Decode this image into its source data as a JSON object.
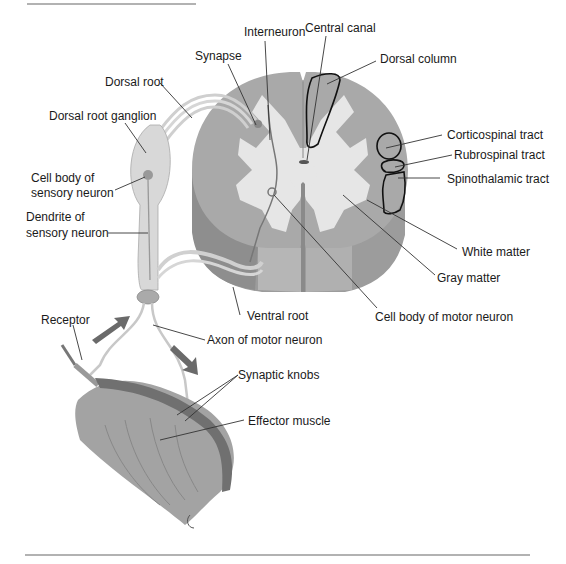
{
  "figure": {
    "labels": {
      "interneuron": "Interneuron",
      "central_canal": "Central canal",
      "synapse": "Synapse",
      "dorsal_column": "Dorsal column",
      "dorsal_root": "Dorsal root",
      "dorsal_root_ganglion": "Dorsal root ganglion",
      "cell_body_sensory_1": "Cell body of",
      "cell_body_sensory_2": "sensory neuron",
      "corticospinal_tract": "Corticospinal tract",
      "rubrospinal_tract": "Rubrospinal tract",
      "spinothalamic_tract": "Spinothalamic tract",
      "dendrite_sensory_1": "Dendrite of",
      "dendrite_sensory_2": "sensory neuron",
      "white_matter": "White matter",
      "gray_matter": "Gray matter",
      "ventral_root": "Ventral root",
      "cell_body_motor": "Cell body of motor neuron",
      "receptor": "Receptor",
      "axon_motor": "Axon of motor neuron",
      "synaptic_knobs": "Synaptic knobs",
      "effector_muscle": "Effector muscle"
    },
    "colors": {
      "white_matter": "#a8a8a8",
      "gray_matter": "#e8e8e8",
      "cord_side": "#9a9a9a",
      "nerve": "#d6d6d6",
      "muscle": "#a0a0a0",
      "muscle_dark": "#6e6e6e",
      "arrow": "#6a6a6a",
      "rule": "#555555"
    }
  }
}
